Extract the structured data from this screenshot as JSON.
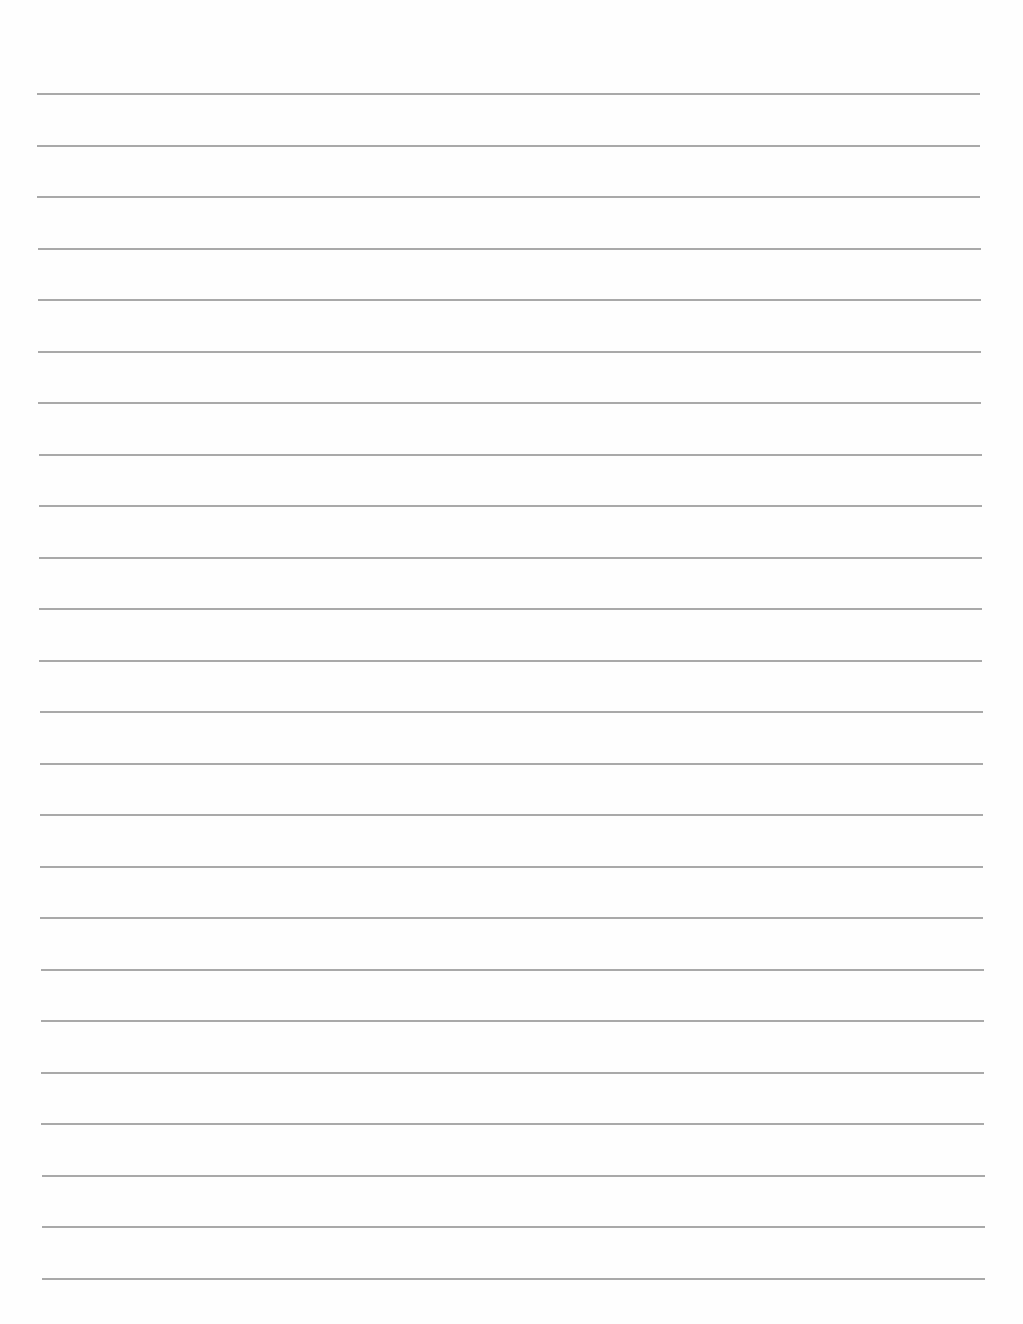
{
  "document": {
    "type": "lined-paper",
    "background_color": "#fefefe",
    "line_color": "#a9a9a9",
    "line_count": 24,
    "first_line_y": 93,
    "line_spacing": 51.5,
    "left_margin_top": 37,
    "left_margin_bottom": 42,
    "line_width": 943,
    "text_lines": []
  }
}
